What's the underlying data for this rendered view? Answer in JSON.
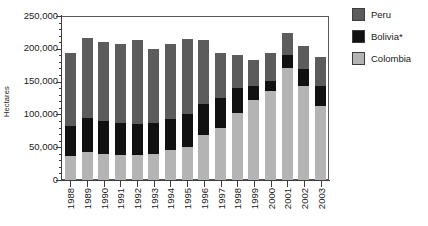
{
  "chart_data": {
    "type": "bar",
    "subtype": "stacked-vertical",
    "title": "",
    "xlabel": "",
    "ylabel": "Hectares",
    "ylim": [
      0,
      250000
    ],
    "ytick_values": [
      0,
      50000,
      100000,
      150000,
      200000,
      250000
    ],
    "ytick_labels": [
      "0",
      "50,000",
      "100,000",
      "150,000",
      "200,000",
      "250,000"
    ],
    "yminor_interval": 10000,
    "grid": false,
    "legend_position": "right",
    "categories": [
      "1988",
      "1989",
      "1990",
      "1991",
      "1992",
      "1993",
      "1994",
      "1995",
      "1996",
      "1997",
      "1998",
      "1999",
      "2000",
      "2001",
      "2002",
      "2003"
    ],
    "series": [
      {
        "name": "Colombia",
        "color": "#b4b4b4",
        "values": [
          37000,
          43000,
          40000,
          38000,
          38000,
          40000,
          45000,
          51000,
          68000,
          79000,
          102000,
          122000,
          136000,
          170000,
          144000,
          113000
        ]
      },
      {
        "name": "Bolivia*",
        "color": "#111111",
        "values": [
          45000,
          52000,
          50000,
          49000,
          47000,
          47000,
          48000,
          49000,
          48000,
          46000,
          38000,
          22000,
          15000,
          20000,
          25000,
          30000
        ]
      },
      {
        "name": "Peru",
        "color": "#5c5c5c",
        "values": [
          112000,
          122000,
          121000,
          121000,
          128000,
          113000,
          115000,
          115000,
          98000,
          69000,
          51000,
          39000,
          43000,
          34000,
          36000,
          44000
        ]
      }
    ],
    "totals": [
      194000,
      217000,
      211000,
      208000,
      213000,
      200000,
      208000,
      215000,
      214000,
      194000,
      191000,
      183000,
      194000,
      224000,
      205000,
      187000
    ],
    "legend_entries": [
      {
        "label": "Peru",
        "color": "#5c5c5c"
      },
      {
        "label": "Bolivia*",
        "color": "#111111"
      },
      {
        "label": "Colombia",
        "color": "#b4b4b4"
      }
    ]
  }
}
